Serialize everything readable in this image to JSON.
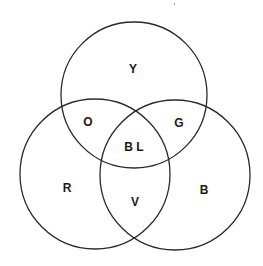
{
  "diagram": {
    "type": "venn-3",
    "title": "",
    "stroke_color": "#2a2a2a",
    "text_color": "#1a1a1a",
    "sets": [
      {
        "id": "top",
        "label": "Y"
      },
      {
        "id": "left",
        "label": "R"
      },
      {
        "id": "right",
        "label": "B"
      }
    ],
    "regions": [
      {
        "id": "top-only",
        "label": "Y"
      },
      {
        "id": "top-left",
        "label": "O"
      },
      {
        "id": "top-right",
        "label": "G"
      },
      {
        "id": "center",
        "label": "B L"
      },
      {
        "id": "left-only",
        "label": "R"
      },
      {
        "id": "left-right",
        "label": "V"
      },
      {
        "id": "right-only",
        "label": "B"
      }
    ]
  }
}
